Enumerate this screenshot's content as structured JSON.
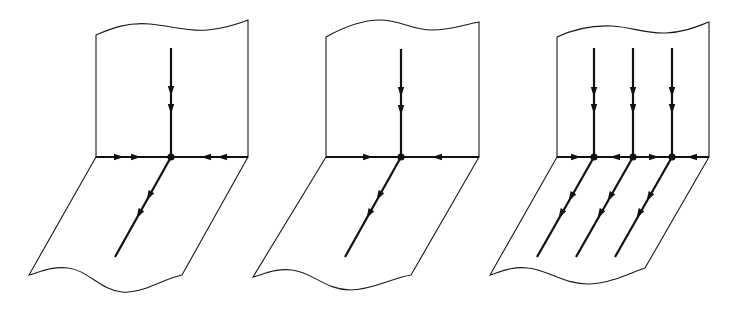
{
  "figure": {
    "stroke_color": "#111111",
    "background": "#ffffff",
    "panels": [
      {
        "id": "panel-1",
        "junctions": 1,
        "vertical_flows": 1,
        "vertical_arrows_per_line": 2,
        "fold_arrows_left": 2,
        "fold_arrows_right": 2,
        "diagonal_flows": 1,
        "diagonal_arrows_per_line": 2
      },
      {
        "id": "panel-2",
        "junctions": 1,
        "vertical_flows": 1,
        "vertical_arrows_per_line": 2,
        "fold_arrows_left": 1,
        "fold_arrows_right": 1,
        "diagonal_flows": 1,
        "diagonal_arrows_per_line": 2
      },
      {
        "id": "panel-3",
        "junctions": 3,
        "vertical_flows": 3,
        "vertical_arrows_per_line": 2,
        "fold_arrow_directions": [
          "right",
          "left",
          "right",
          "left"
        ],
        "diagonal_flows": 3,
        "diagonal_arrows_per_line": 2
      }
    ]
  }
}
